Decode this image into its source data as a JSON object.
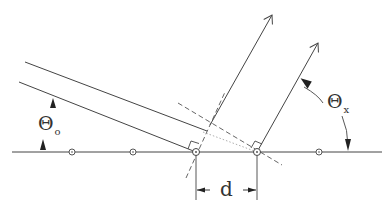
{
  "diagram": {
    "type": "diffraction-geometry",
    "labels": {
      "incident_angle_symbol": "Θ",
      "incident_angle_subscript": "o",
      "exit_angle_symbol": "Θ",
      "exit_angle_subscript": "x",
      "spacing": "d"
    },
    "atoms_x": [
      72,
      133,
      196,
      257,
      319
    ],
    "baseline_y": 152,
    "colors": {
      "line": "#444444",
      "dashed": "#555555",
      "dotted": "#888888",
      "text": "#333333",
      "background": "#ffffff"
    }
  }
}
